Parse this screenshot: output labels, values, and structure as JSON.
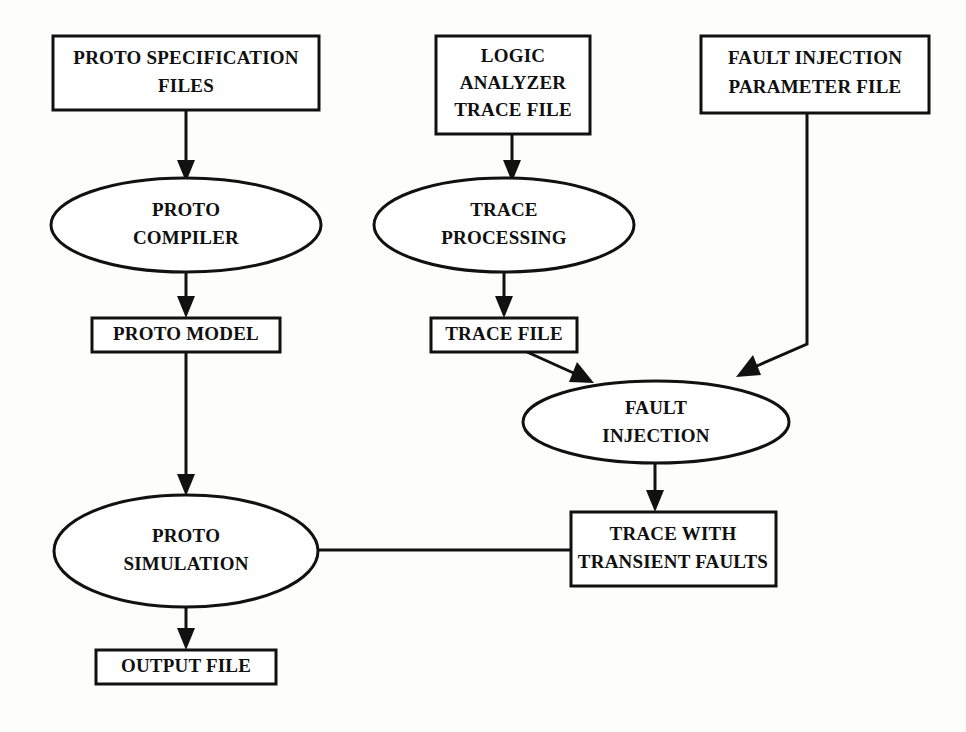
{
  "diagram": {
    "background_color": "#fdfdfc",
    "line_color": "#111111",
    "text_color": "#101010",
    "nodes": [
      {
        "id": "proto-specification-files",
        "shape": "rectangle",
        "lines": [
          "PROTO SPECIFICATION",
          "FILES"
        ]
      },
      {
        "id": "logic-analyzer-trace-file",
        "shape": "rectangle",
        "lines": [
          "LOGIC",
          "ANALYZER",
          "TRACE FILE"
        ]
      },
      {
        "id": "fault-injection-parameter-file",
        "shape": "rectangle",
        "lines": [
          "FAULT INJECTION",
          "PARAMETER FILE"
        ]
      },
      {
        "id": "proto-compiler",
        "shape": "ellipse",
        "lines": [
          "PROTO",
          "COMPILER"
        ]
      },
      {
        "id": "trace-processing",
        "shape": "ellipse",
        "lines": [
          "TRACE",
          "PROCESSING"
        ]
      },
      {
        "id": "proto-model",
        "shape": "rectangle",
        "lines": [
          "PROTO MODEL"
        ]
      },
      {
        "id": "trace-file",
        "shape": "rectangle",
        "lines": [
          "TRACE FILE"
        ]
      },
      {
        "id": "fault-injection",
        "shape": "ellipse",
        "lines": [
          "FAULT",
          "INJECTION"
        ]
      },
      {
        "id": "proto-simulation",
        "shape": "ellipse",
        "lines": [
          "PROTO",
          "SIMULATION"
        ]
      },
      {
        "id": "trace-with-transient-faults",
        "shape": "rectangle",
        "lines": [
          "TRACE WITH",
          "TRANSIENT FAULTS"
        ]
      },
      {
        "id": "output-file",
        "shape": "rectangle",
        "lines": [
          "OUTPUT FILE"
        ]
      }
    ],
    "edges": [
      {
        "from": "proto-specification-files",
        "to": "proto-compiler"
      },
      {
        "from": "proto-compiler",
        "to": "proto-model"
      },
      {
        "from": "proto-model",
        "to": "proto-simulation"
      },
      {
        "from": "logic-analyzer-trace-file",
        "to": "trace-processing"
      },
      {
        "from": "trace-processing",
        "to": "trace-file"
      },
      {
        "from": "trace-file",
        "to": "fault-injection"
      },
      {
        "from": "fault-injection-parameter-file",
        "to": "fault-injection"
      },
      {
        "from": "fault-injection",
        "to": "trace-with-transient-faults"
      },
      {
        "from": "trace-with-transient-faults",
        "to": "proto-simulation"
      },
      {
        "from": "proto-simulation",
        "to": "output-file"
      }
    ]
  },
  "labels": {
    "proto_specification_files_l1": "PROTO SPECIFICATION",
    "proto_specification_files_l2": "FILES",
    "logic_analyzer_l1": "LOGIC",
    "logic_analyzer_l2": "ANALYZER",
    "logic_analyzer_l3": "TRACE FILE",
    "fault_param_l1": "FAULT INJECTION",
    "fault_param_l2": "PARAMETER FILE",
    "proto_compiler_l1": "PROTO",
    "proto_compiler_l2": "COMPILER",
    "trace_processing_l1": "TRACE",
    "trace_processing_l2": "PROCESSING",
    "proto_model": "PROTO MODEL",
    "trace_file": "TRACE FILE",
    "fault_injection_l1": "FAULT",
    "fault_injection_l2": "INJECTION",
    "proto_simulation_l1": "PROTO",
    "proto_simulation_l2": "SIMULATION",
    "trace_transient_l1": "TRACE WITH",
    "trace_transient_l2": "TRANSIENT FAULTS",
    "output_file": "OUTPUT FILE"
  }
}
